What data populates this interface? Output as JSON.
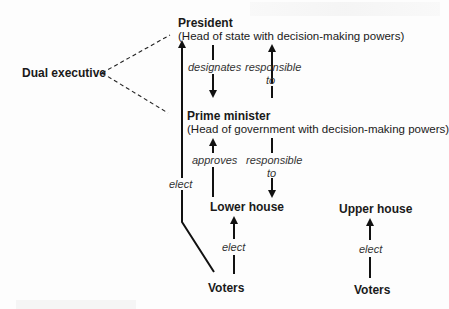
{
  "diagram": {
    "dual_executive": "Dual executive",
    "president": {
      "title": "President",
      "subtitle": "(Head of state with decision-making powers)"
    },
    "prime_minister": {
      "title": "Prime minister",
      "subtitle": "(Head of government with decision-making powers)"
    },
    "relations": {
      "designates": "designates",
      "responsible_top_1": "responsible",
      "responsible_top_2": "to",
      "approves": "approves",
      "responsible_bottom_1": "responsible",
      "responsible_bottom_2": "to",
      "elect_president": "elect",
      "elect_lower": "elect",
      "elect_upper": "elect"
    },
    "lower_house": "Lower house",
    "upper_house": "Upper house",
    "voters_left": "Voters",
    "voters_right": "Voters"
  }
}
